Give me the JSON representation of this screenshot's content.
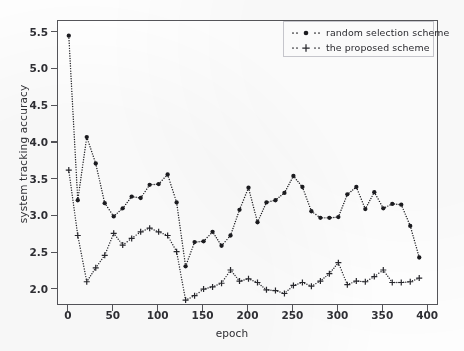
{
  "chart_data": {
    "type": "line",
    "title": "",
    "xlabel": "epoch",
    "ylabel": "system tracking accuracy",
    "xlim": [
      -12,
      412
    ],
    "ylim": [
      1.78,
      5.66
    ],
    "xticks": [
      0,
      50,
      100,
      150,
      200,
      250,
      300,
      350,
      400
    ],
    "xtick_labels": [
      "0",
      "50",
      "100",
      "150",
      "200",
      "250",
      "300",
      "350",
      "400"
    ],
    "yticks": [
      2.0,
      2.5,
      3.0,
      3.5,
      4.0,
      4.5,
      5.0,
      5.5
    ],
    "ytick_labels": [
      "2.0",
      "2.5",
      "3.0",
      "3.5",
      "4.0",
      "4.5",
      "5.0",
      "5.5"
    ],
    "grid": false,
    "legend_position": "upper right",
    "linestyle": "dotted",
    "x": [
      0,
      10,
      20,
      30,
      40,
      50,
      60,
      70,
      80,
      90,
      100,
      110,
      120,
      130,
      140,
      150,
      160,
      170,
      180,
      190,
      200,
      210,
      220,
      230,
      240,
      250,
      260,
      270,
      280,
      290,
      300,
      310,
      320,
      330,
      340,
      350,
      360,
      370,
      380,
      390
    ],
    "series": [
      {
        "name": "random selection scheme",
        "marker": "filled-circle",
        "color": "#1b1b1f",
        "values": [
          5.46,
          3.22,
          4.08,
          3.72,
          3.18,
          3.0,
          3.11,
          3.27,
          3.25,
          3.43,
          3.44,
          3.57,
          3.19,
          2.32,
          2.65,
          2.66,
          2.79,
          2.6,
          2.74,
          3.09,
          3.39,
          2.92,
          3.19,
          3.22,
          3.32,
          3.55,
          3.4,
          3.07,
          2.98,
          2.98,
          2.99,
          3.3,
          3.4,
          3.1,
          3.33,
          3.11,
          3.17,
          3.16,
          2.87,
          2.44
        ]
      },
      {
        "name": "the proposed scheme",
        "marker": "plus",
        "color": "#27272c",
        "values": [
          3.63,
          2.74,
          2.11,
          2.3,
          2.47,
          2.77,
          2.61,
          2.7,
          2.79,
          2.84,
          2.79,
          2.74,
          2.52,
          1.86,
          1.92,
          2.01,
          2.04,
          2.09,
          2.27,
          2.12,
          2.15,
          2.1,
          2.0,
          1.99,
          1.95,
          2.06,
          2.1,
          2.05,
          2.12,
          2.22,
          2.37,
          2.07,
          2.12,
          2.11,
          2.18,
          2.27,
          2.1,
          2.1,
          2.11,
          2.16
        ]
      }
    ]
  },
  "legend": {
    "entries": [
      {
        "label": "random selection scheme",
        "marker": "filled-circle"
      },
      {
        "label": "the proposed scheme",
        "marker": "plus"
      }
    ]
  },
  "axes": {
    "x_title": "epoch",
    "y_title": "system tracking accuracy"
  },
  "colors": {
    "series_dark": "#1b1b1f",
    "series_plus": "#27272c",
    "axis": "#55555a",
    "text": "#2f2f34",
    "background": "#ffffff"
  }
}
